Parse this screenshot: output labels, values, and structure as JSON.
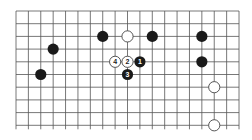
{
  "board": {
    "columns": 19,
    "rows": 10,
    "origin": {
      "x": 16,
      "y": 11
    },
    "spacing": {
      "x": 12.39,
      "y": 12.7
    },
    "line_color": "#555555",
    "background": "#ffffff"
  },
  "stones": [
    {
      "color": "black",
      "col": 7,
      "row": 2,
      "label": ""
    },
    {
      "color": "white",
      "col": 9,
      "row": 2,
      "label": ""
    },
    {
      "color": "black",
      "col": 11,
      "row": 2,
      "label": ""
    },
    {
      "color": "black",
      "col": 15,
      "row": 2,
      "label": ""
    },
    {
      "color": "black",
      "col": 3,
      "row": 3,
      "label": ""
    },
    {
      "color": "white",
      "col": 8,
      "row": 4,
      "label": "4"
    },
    {
      "color": "white",
      "col": 9,
      "row": 4,
      "label": "2"
    },
    {
      "color": "black",
      "col": 10,
      "row": 4,
      "label": "1"
    },
    {
      "color": "black",
      "col": 15,
      "row": 4,
      "label": ""
    },
    {
      "color": "black",
      "col": 2,
      "row": 5,
      "label": ""
    },
    {
      "color": "black",
      "col": 9,
      "row": 5,
      "label": "3"
    },
    {
      "color": "white",
      "col": 16,
      "row": 6,
      "label": ""
    },
    {
      "color": "white",
      "col": 16,
      "row": 9,
      "label": ""
    }
  ],
  "colors": {
    "black_stone": "#1a1a1a",
    "white_stone": "#ffffff",
    "white_stroke": "#444444",
    "black_label": "#ffffff",
    "white_label": "#222222"
  }
}
